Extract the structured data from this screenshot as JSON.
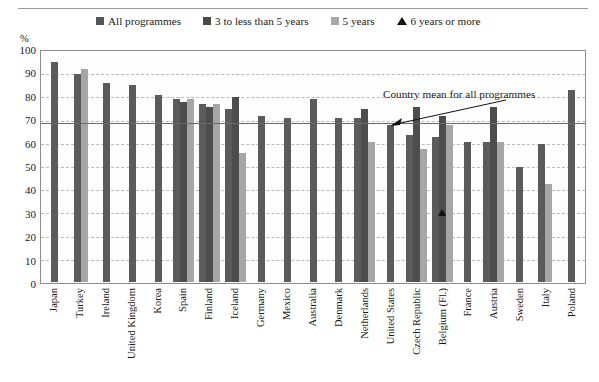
{
  "header": {
    "ghost_text": " "
  },
  "axis": {
    "unit_label": "%",
    "y_ticks": [
      100,
      90,
      80,
      70,
      60,
      50,
      40,
      30,
      20,
      10,
      0
    ]
  },
  "legend": {
    "items": [
      {
        "label": "All programmes",
        "swatch": "dark",
        "icon": "square-swatch-icon",
        "color": "#5b5b5b"
      },
      {
        "label": "3 to less than 5 years",
        "swatch": "dark2",
        "icon": "square-swatch-icon",
        "color": "#4d4d4d"
      },
      {
        "label": "5 years",
        "swatch": "light",
        "icon": "square-swatch-icon",
        "color": "#a6a6a6"
      },
      {
        "label": "6 years or more",
        "swatch": "tri",
        "icon": "triangle-marker-icon",
        "color": "#111111"
      }
    ]
  },
  "annotation": {
    "text": "Country mean for all programmes"
  },
  "chart_data": {
    "type": "bar",
    "title": "",
    "xlabel": "",
    "ylabel": "%",
    "ylim": [
      0,
      100
    ],
    "ytick_step": 10,
    "grid": true,
    "legend_position": "top",
    "mean_line": 69,
    "mean_line_label": "Country mean for all programmes",
    "categories": [
      "Japan",
      "Turkey",
      "Ireland",
      "United Kingdom",
      "Korea",
      "Spain",
      "Finland",
      "Iceland",
      "Germany",
      "Mexico",
      "Australia",
      "Denmark",
      "Netherlands",
      "United States",
      "Czech Republic",
      "Belgium (Fl.)",
      "France",
      "Austria",
      "Sweden",
      "Italy",
      "Poland"
    ],
    "series": [
      {
        "name": "All programmes",
        "color": "#5b5b5b",
        "values": [
          94,
          89,
          85,
          84,
          80,
          78,
          76,
          74,
          71,
          70,
          78,
          70,
          70,
          67,
          63,
          62,
          60,
          60,
          49,
          59,
          82
        ]
      },
      {
        "name": "3 to less than 5 years",
        "color": "#4d4d4d",
        "values": [
          null,
          null,
          null,
          null,
          null,
          77,
          75,
          79,
          null,
          null,
          null,
          null,
          74,
          null,
          75,
          71,
          null,
          75,
          null,
          null,
          null
        ]
      },
      {
        "name": "5 years",
        "color": "#a6a6a6",
        "values": [
          null,
          91,
          null,
          null,
          null,
          78,
          76,
          55,
          null,
          null,
          null,
          null,
          60,
          null,
          57,
          67,
          null,
          60,
          null,
          42,
          null
        ]
      },
      {
        "name": "6 years or more",
        "color": "#111111",
        "marker": "triangle",
        "values": [
          null,
          null,
          null,
          null,
          null,
          null,
          null,
          null,
          null,
          null,
          null,
          null,
          null,
          null,
          null,
          28,
          null,
          null,
          null,
          null,
          null
        ]
      }
    ]
  }
}
